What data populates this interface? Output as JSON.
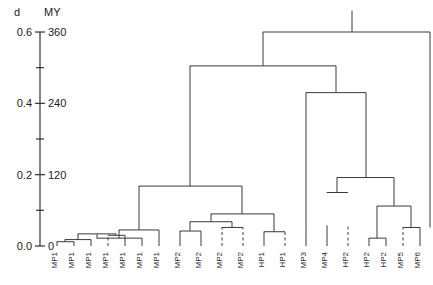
{
  "chart_data": {
    "type": "tree",
    "title": "",
    "subtitle": "",
    "xlabel": "",
    "ylabel": "d",
    "ylabel_secondary": "MY",
    "grid": false,
    "legend": "none",
    "axes": [
      {
        "name": "d",
        "header": "d",
        "ylim": [
          0.0,
          0.6
        ],
        "major_ticks": [
          0.0,
          0.2,
          0.4,
          0.6
        ],
        "major_tick_labels": [
          "0.0",
          "0.2",
          "0.4",
          "0.6"
        ],
        "minor_ticks": [
          0.1,
          0.3,
          0.5
        ]
      },
      {
        "name": "MY",
        "header": "MY",
        "ylim": [
          0,
          360
        ],
        "major_ticks": [
          0,
          120,
          240,
          360
        ],
        "major_tick_labels": [
          "0",
          "120",
          "240",
          "360"
        ],
        "minor_ticks": [
          60,
          180,
          300
        ]
      }
    ],
    "leaves": [
      {
        "index": 0,
        "label": "MP1",
        "x": 57,
        "height": 0.012,
        "dashed": false
      },
      {
        "index": 1,
        "label": "MP1",
        "x": 74,
        "height": 0.012,
        "dashed": false
      },
      {
        "index": 2,
        "label": "MP1",
        "x": 91,
        "height": 0.018,
        "dashed": false
      },
      {
        "index": 3,
        "label": "MP1",
        "x": 108,
        "height": 0.03,
        "dashed": true
      },
      {
        "index": 4,
        "label": "MP1",
        "x": 125,
        "height": 0.03,
        "dashed": false
      },
      {
        "index": 5,
        "label": "MP1",
        "x": 142,
        "height": 0.022,
        "dashed": false
      },
      {
        "index": 6,
        "label": "MP1",
        "x": 159,
        "height": 0.045,
        "dashed": false
      },
      {
        "index": 7,
        "label": "MP2",
        "x": 180,
        "height": 0.042,
        "dashed": false
      },
      {
        "index": 8,
        "label": "MP2",
        "x": 201,
        "height": 0.042,
        "dashed": false
      },
      {
        "index": 9,
        "label": "MP2",
        "x": 222,
        "height": 0.052,
        "dashed": true
      },
      {
        "index": 10,
        "label": "MP2",
        "x": 243,
        "height": 0.052,
        "dashed": true
      },
      {
        "index": 11,
        "label": "HP1",
        "x": 264,
        "height": 0.04,
        "dashed": false
      },
      {
        "index": 12,
        "label": "HP1",
        "x": 285,
        "height": 0.04,
        "dashed": true
      },
      {
        "index": 13,
        "label": "MP3",
        "x": 306,
        "height": 0.058,
        "dashed": false
      },
      {
        "index": 14,
        "label": "MP4",
        "x": 327,
        "height": 0.058,
        "dashed": false
      },
      {
        "index": 15,
        "label": "HP2",
        "x": 348,
        "height": 0.058,
        "dashed": true
      },
      {
        "index": 16,
        "label": "HP2",
        "x": 369,
        "height": 0.022,
        "dashed": false
      },
      {
        "index": 17,
        "label": "HP2",
        "x": 386,
        "height": 0.022,
        "dashed": false
      },
      {
        "index": 18,
        "label": "MP5",
        "x": 403,
        "height": 0.052,
        "dashed": true
      },
      {
        "index": 19,
        "label": "MP6",
        "x": 420,
        "height": 0.052,
        "dashed": false
      }
    ],
    "merges": [
      {
        "id": "n1",
        "left_x": 57,
        "right_x": 74,
        "height": 0.012,
        "note": "MP1+MP1"
      },
      {
        "id": "n2",
        "left_x": 65,
        "right_x": 91,
        "height": 0.018,
        "note": "(n1)+MP1"
      },
      {
        "id": "n3",
        "left_x": 108,
        "right_x": 125,
        "height": 0.03,
        "note": "MP1+MP1"
      },
      {
        "id": "n4",
        "left_x": 78,
        "right_x": 116,
        "height": 0.034,
        "note": "(n2)+(n3)"
      },
      {
        "id": "n5",
        "left_x": 97,
        "right_x": 142,
        "height": 0.022,
        "note": "inner MP1 join"
      },
      {
        "id": "n6",
        "left_x": 119,
        "right_x": 159,
        "height": 0.045,
        "note": "(n4)+MP1"
      },
      {
        "id": "n7",
        "left_x": 180,
        "right_x": 201,
        "height": 0.042,
        "note": "MP2+MP2"
      },
      {
        "id": "n8",
        "left_x": 222,
        "right_x": 243,
        "height": 0.052,
        "note": "MP2+MP2"
      },
      {
        "id": "n9",
        "left_x": 264,
        "right_x": 285,
        "height": 0.04,
        "note": "HP1+HP1"
      },
      {
        "id": "n10",
        "left_x": 190,
        "right_x": 232,
        "height": 0.068,
        "note": "(n7)+(n8)"
      },
      {
        "id": "n11",
        "left_x": 211,
        "right_x": 274,
        "height": 0.09,
        "note": "(n10)+(n9)"
      },
      {
        "id": "n12",
        "left_x": 139,
        "right_x": 242,
        "height": 0.168,
        "note": "(n6)+(n11)"
      },
      {
        "id": "n13",
        "left_x": 369,
        "right_x": 386,
        "height": 0.022,
        "note": "HP2+HP2"
      },
      {
        "id": "n14",
        "left_x": 403,
        "right_x": 420,
        "height": 0.052,
        "note": "MP5+MP6"
      },
      {
        "id": "n15",
        "left_x": 377,
        "right_x": 411,
        "height": 0.112,
        "note": "(n13)+(n14)"
      },
      {
        "id": "n16",
        "left_x": 327,
        "right_x": 348,
        "height": 0.15,
        "note": "MP4+HP2"
      },
      {
        "id": "n17",
        "left_x": 337,
        "right_x": 394,
        "height": 0.192,
        "note": "(n16)+(n15)"
      },
      {
        "id": "n18",
        "left_x": 306,
        "right_x": 366,
        "height": 0.43,
        "note": "MP3+(n17)"
      },
      {
        "id": "n19",
        "left_x": 190,
        "right_x": 336,
        "height": 0.505,
        "note": "(n12)+(n18)"
      },
      {
        "id": "root",
        "left_x": 263,
        "right_x": 430,
        "height": 0.6,
        "note": "root stem"
      }
    ],
    "root_stem": {
      "x": 352,
      "top": 0.66,
      "height": 0.6
    }
  },
  "axis_headers": {
    "left": "d",
    "right": "MY"
  }
}
